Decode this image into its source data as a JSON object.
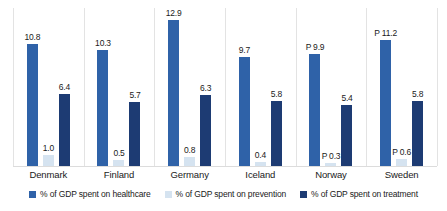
{
  "chart_data": {
    "type": "bar",
    "title": "",
    "subtitle": "",
    "xlabel": "",
    "ylabel": "",
    "ylim": [
      0,
      14
    ],
    "grid": false,
    "legend_position": "bottom",
    "categories": [
      "Denmark",
      "Finland",
      "Germany",
      "Iceland",
      "Norway",
      "Sweden"
    ],
    "series": [
      {
        "name": "% of GDP spent on healthcare",
        "color": "#2f62a8",
        "values": [
          10.8,
          10.3,
          12.9,
          9.7,
          9.9,
          11.2
        ],
        "labels": [
          "10.8",
          "10.3",
          "12.9",
          "9.7",
          "P 9.9",
          "P 11.2"
        ]
      },
      {
        "name": "% of GDP spent on prevention",
        "color": "#d5e3f0",
        "values": [
          1.0,
          0.5,
          0.8,
          0.4,
          0.3,
          0.6
        ],
        "labels": [
          "1.0",
          "0.5",
          "0.8",
          "0.4",
          "P 0.3",
          "P 0.6"
        ]
      },
      {
        "name": "% of GDP spent on treatment",
        "color": "#1d3b73",
        "values": [
          6.4,
          5.7,
          6.3,
          5.8,
          5.4,
          5.8
        ],
        "labels": [
          "6.4",
          "5.7",
          "6.3",
          "5.8",
          "5.4",
          "5.8"
        ]
      }
    ]
  },
  "legend": {
    "items": [
      {
        "label": "% of GDP spent on healthcare",
        "color": "#2f62a8"
      },
      {
        "label": "% of GDP spent on prevention",
        "color": "#d5e3f0"
      },
      {
        "label": "% of GDP spent on treatment",
        "color": "#1d3b73"
      }
    ]
  },
  "axis": {
    "baseline_color": "#dcdcdc",
    "separator_color": "#e3e3e3"
  },
  "groups": [
    {
      "name": "Denmark",
      "bars": [
        {
          "series": "healthcare",
          "value": 10.8,
          "label": "10.8",
          "color": "#2f62a8"
        },
        {
          "series": "prevention",
          "value": 1.0,
          "label": "1.0",
          "color": "#d5e3f0"
        },
        {
          "series": "treatment",
          "value": 6.4,
          "label": "6.4",
          "color": "#1d3b73"
        }
      ]
    },
    {
      "name": "Finland",
      "bars": [
        {
          "series": "healthcare",
          "value": 10.3,
          "label": "10.3",
          "color": "#2f62a8"
        },
        {
          "series": "prevention",
          "value": 0.5,
          "label": "0.5",
          "color": "#d5e3f0"
        },
        {
          "series": "treatment",
          "value": 5.7,
          "label": "5.7",
          "color": "#1d3b73"
        }
      ]
    },
    {
      "name": "Germany",
      "bars": [
        {
          "series": "healthcare",
          "value": 12.9,
          "label": "12.9",
          "color": "#2f62a8"
        },
        {
          "series": "prevention",
          "value": 0.8,
          "label": "0.8",
          "color": "#d5e3f0"
        },
        {
          "series": "treatment",
          "value": 6.3,
          "label": "6.3",
          "color": "#1d3b73"
        }
      ]
    },
    {
      "name": "Iceland",
      "bars": [
        {
          "series": "healthcare",
          "value": 9.7,
          "label": "9.7",
          "color": "#2f62a8"
        },
        {
          "series": "prevention",
          "value": 0.4,
          "label": "0.4",
          "color": "#d5e3f0"
        },
        {
          "series": "treatment",
          "value": 5.8,
          "label": "5.8",
          "color": "#1d3b73"
        }
      ]
    },
    {
      "name": "Norway",
      "bars": [
        {
          "series": "healthcare",
          "value": 9.9,
          "label": "P 9.9",
          "color": "#2f62a8"
        },
        {
          "series": "prevention",
          "value": 0.3,
          "label": "P 0.3",
          "color": "#d5e3f0"
        },
        {
          "series": "treatment",
          "value": 5.4,
          "label": "5.4",
          "color": "#1d3b73"
        }
      ]
    },
    {
      "name": "Sweden",
      "bars": [
        {
          "series": "healthcare",
          "value": 11.2,
          "label": "P 11.2",
          "color": "#2f62a8"
        },
        {
          "series": "prevention",
          "value": 0.6,
          "label": "P 0.6",
          "color": "#d5e3f0"
        },
        {
          "series": "treatment",
          "value": 5.8,
          "label": "5.8",
          "color": "#1d3b73"
        }
      ]
    }
  ]
}
